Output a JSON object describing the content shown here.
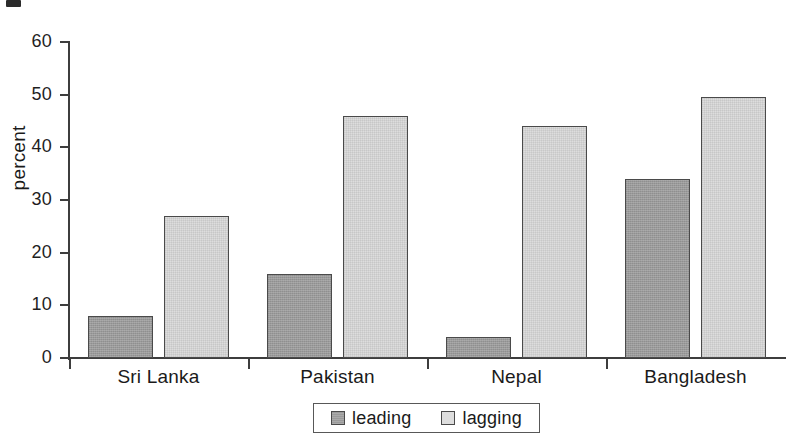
{
  "chart_data": {
    "type": "bar",
    "title": "",
    "subtitle": "",
    "xlabel": "",
    "ylabel": "percent",
    "categories": [
      "Sri Lanka",
      "Pakistan",
      "Nepal",
      "Bangladesh"
    ],
    "series": [
      {
        "name": "leading",
        "color": "#9a9a9a",
        "values": [
          8,
          16,
          4,
          34
        ]
      },
      {
        "name": "lagging",
        "color": "#dddddd",
        "values": [
          27,
          46,
          44,
          49.5
        ]
      }
    ],
    "ylim": [
      0,
      60
    ],
    "yticks": [
      0,
      10,
      20,
      30,
      40,
      50,
      60
    ],
    "ytick_labels": [
      "0",
      "10",
      "20",
      "30",
      "40",
      "50",
      "60"
    ],
    "grid": false,
    "legend_position": "bottom-center",
    "legend_entries": [
      "leading",
      "lagging"
    ]
  },
  "axis": {
    "y_label": "percent",
    "y_ticks": [
      "60",
      "50",
      "40",
      "30",
      "20",
      "10",
      "0"
    ],
    "x_categories": [
      "Sri Lanka",
      "Pakistan",
      "Nepal",
      "Bangladesh"
    ]
  },
  "legend": {
    "items": [
      {
        "label": "leading"
      },
      {
        "label": "lagging"
      }
    ]
  },
  "colors": {
    "leading": "#9a9a9a",
    "lagging": "#dddddd",
    "axis": "#3d3d3d",
    "bar_outline": "#4a4a4a",
    "text": "#1a1a1a",
    "background": "#ffffff"
  }
}
